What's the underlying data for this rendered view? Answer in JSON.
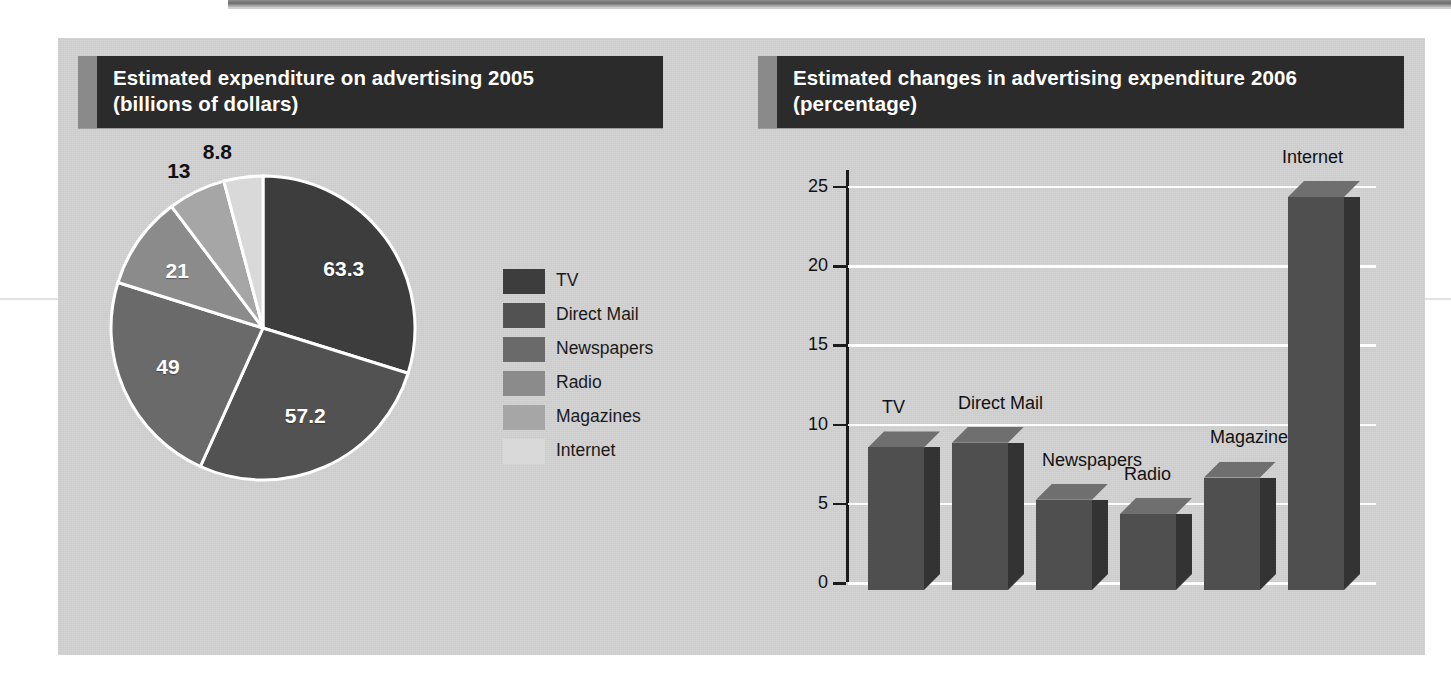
{
  "page": {
    "background": "#ffffff",
    "panel_color": "#d2d2d2"
  },
  "left_chart": {
    "title_line1": "Estimated expenditure on advertising 2005",
    "title_line2": "(billions of dollars)",
    "title_bar_color": "#2b2b2b",
    "title_stripe_color": "#8a8a8a"
  },
  "right_chart": {
    "title_line1": "Estimated changes in advertising expenditure 2006",
    "title_line2": "(percentage)",
    "title_bar_color": "#2b2b2b",
    "title_stripe_color": "#8a8a8a"
  },
  "legend": {
    "items": [
      {
        "label": "TV",
        "color": "#3d3d3d"
      },
      {
        "label": "Direct Mail",
        "color": "#525252"
      },
      {
        "label": "Newspapers",
        "color": "#6a6a6a"
      },
      {
        "label": "Radio",
        "color": "#8b8b8b"
      },
      {
        "label": "Magazines",
        "color": "#a6a6a6"
      },
      {
        "label": "Internet",
        "color": "#d9d9d9"
      }
    ]
  },
  "chart_data": [
    {
      "type": "pie",
      "title": "Estimated expenditure on advertising 2005 (billions of dollars)",
      "unit": "billions of dollars",
      "categories": [
        "TV",
        "Direct Mail",
        "Newspapers",
        "Radio",
        "Magazines",
        "Internet"
      ],
      "values": [
        63.3,
        57.2,
        49,
        21,
        13,
        8.8
      ],
      "labels": [
        "63.3",
        "57.2",
        "49",
        "21",
        "13",
        "8.8"
      ],
      "colors": [
        "#3d3d3d",
        "#525252",
        "#6a6a6a",
        "#8b8b8b",
        "#a6a6a6",
        "#d9d9d9"
      ],
      "total": 212.3,
      "start_angle_deg": 0,
      "direction": "clockwise",
      "legend_position": "right",
      "slice_separator_color": "#ffffff"
    },
    {
      "type": "bar",
      "title": "Estimated changes in advertising expenditure 2006 (percentage)",
      "xlabel": "",
      "ylabel": "",
      "unit": "percentage",
      "categories": [
        "TV",
        "Direct Mail",
        "Newspapers",
        "Radio",
        "Magazines",
        "Internet"
      ],
      "values": [
        9,
        9.3,
        5.7,
        4.8,
        7.1,
        24.8
      ],
      "ylim": [
        0,
        26
      ],
      "yticks": [
        0,
        5,
        10,
        15,
        20,
        25
      ],
      "ytick_labels": [
        "0",
        "5",
        "10",
        "15",
        "20",
        "25"
      ],
      "grid": true,
      "gridline_color": "#ffffff",
      "bar_front_color": "#4f4f4f",
      "bar_side_color": "#333333",
      "bar_top_color": "#6f6f6f",
      "style": "3d-columns",
      "legend_position": "none",
      "labels_above_bars": true
    }
  ]
}
